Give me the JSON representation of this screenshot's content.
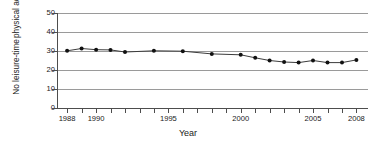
{
  "chart_data": {
    "type": "line",
    "title": "",
    "xlabel": "Year",
    "ylabel": "No leisure-time physical activity (%)",
    "ylabel_lines": [
      "No leisure-time",
      "physical activity (%)"
    ],
    "xlim": [
      1987.3,
      2008.8
    ],
    "ylim": [
      0,
      50
    ],
    "yticks": [
      0,
      10,
      20,
      30,
      40,
      50
    ],
    "ytick_labels": [
      "0",
      "10",
      "20",
      "30",
      "40",
      "50"
    ],
    "xticks": [
      1988,
      1989,
      1990,
      1991,
      1992,
      1993,
      1994,
      1995,
      1996,
      1997,
      1998,
      1999,
      2000,
      2001,
      2002,
      2003,
      2004,
      2005,
      2006,
      2007,
      2008
    ],
    "xtick_labels_shown": [
      "1988",
      "1990",
      "1995",
      "2000",
      "2005",
      "2008"
    ],
    "xtick_labels_shown_at": [
      1988,
      1990,
      1995,
      2000,
      2005,
      2008
    ],
    "grid": "horizontal",
    "legend": "none",
    "marker": "filled-circle",
    "series": [
      {
        "name": "No leisure-time physical activity",
        "x": [
          1988,
          1989,
          1990,
          1991,
          1992,
          1994,
          1996,
          1998,
          2000,
          2001,
          2002,
          2003,
          2004,
          2005,
          2006,
          2007,
          2008
        ],
        "values": [
          30.1,
          31.3,
          30.7,
          30.6,
          29.5,
          30.1,
          29.9,
          28.5,
          28.0,
          26.4,
          25.0,
          24.2,
          23.9,
          25.0,
          23.9,
          23.9,
          25.3
        ]
      }
    ]
  },
  "axis": {
    "x_title": "Year",
    "y_title_line1": "No leisure-time",
    "y_title_line2": "physical activity (%)"
  }
}
